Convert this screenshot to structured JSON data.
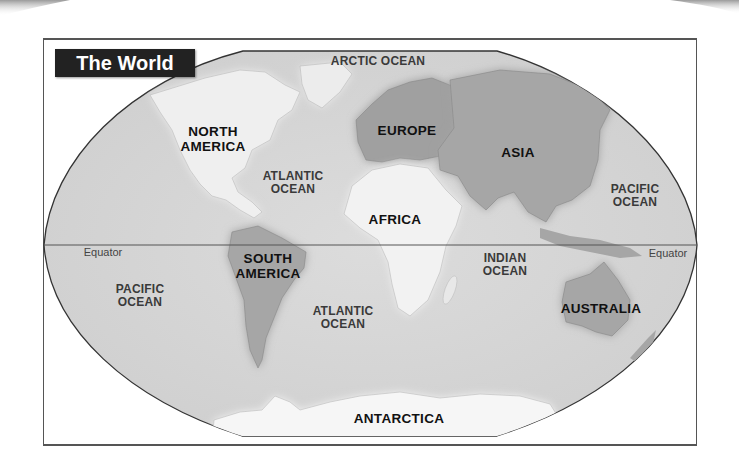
{
  "map": {
    "title": "The World",
    "colors": {
      "ocean": "#d6d6d6",
      "land_light": "#f4f4f4",
      "land_dark": "#a8a8a8",
      "outline": "#333333",
      "title_bg": "#222222",
      "title_text": "#ffffff"
    },
    "labels": {
      "arctic_ocean": "ARCTIC OCEAN",
      "north_america_1": "NORTH",
      "north_america_2": "AMERICA",
      "europe": "EUROPE",
      "asia": "ASIA",
      "atlantic_north_1": "ATLANTIC",
      "atlantic_north_2": "OCEAN",
      "africa": "AFRICA",
      "pacific_east_1": "PACIFIC",
      "pacific_east_2": "OCEAN",
      "equator_left": "Equator",
      "equator_right": "Equator",
      "south_america_1": "SOUTH",
      "south_america_2": "AMERICA",
      "indian_ocean_1": "INDIAN",
      "indian_ocean_2": "OCEAN",
      "pacific_west_1": "PACIFIC",
      "pacific_west_2": "OCEAN",
      "atlantic_south_1": "ATLANTIC",
      "atlantic_south_2": "OCEAN",
      "australia": "AUSTRALIA",
      "antarctica": "ANTARCTICA"
    }
  }
}
